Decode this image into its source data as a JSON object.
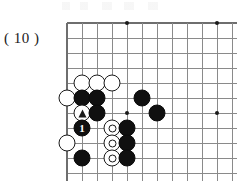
{
  "figure": {
    "label": "( 10 )"
  },
  "board": {
    "type": "go-board-diagram",
    "grid_spacing": 15,
    "origin_x": 67,
    "origin_y": 23,
    "columns": 12,
    "rows": 11,
    "edges": {
      "left": true,
      "top": true,
      "right": false,
      "bottom": true
    },
    "line_color": "#8a8a8a",
    "edge_color": "#6e6e6e",
    "star_point_color": "#1a1a1a",
    "black_color": "#101010",
    "white_color": "#ffffff",
    "star_points": [
      {
        "col": 4,
        "row": 0
      },
      {
        "col": 10,
        "row": 0
      },
      {
        "col": 4,
        "row": 6
      },
      {
        "col": 10,
        "row": 6
      }
    ],
    "stones": [
      {
        "col": 1,
        "row": 4,
        "color": "white",
        "marker": "none",
        "label": ""
      },
      {
        "col": 2,
        "row": 4,
        "color": "white",
        "marker": "none",
        "label": ""
      },
      {
        "col": 3,
        "row": 4,
        "color": "white",
        "marker": "none",
        "label": ""
      },
      {
        "col": 0,
        "row": 5,
        "color": "white",
        "marker": "none",
        "label": ""
      },
      {
        "col": 1,
        "row": 5,
        "color": "black",
        "marker": "none",
        "label": ""
      },
      {
        "col": 2,
        "row": 5,
        "color": "black",
        "marker": "none",
        "label": ""
      },
      {
        "col": 5,
        "row": 5,
        "color": "black",
        "marker": "none",
        "label": ""
      },
      {
        "col": 1,
        "row": 6,
        "color": "white",
        "marker": "triangle",
        "label": ""
      },
      {
        "col": 2,
        "row": 6,
        "color": "black",
        "marker": "none",
        "label": ""
      },
      {
        "col": 6,
        "row": 6,
        "color": "black",
        "marker": "none",
        "label": ""
      },
      {
        "col": 1,
        "row": 7,
        "color": "black",
        "marker": "none",
        "label": "1"
      },
      {
        "col": 3,
        "row": 7,
        "color": "white",
        "marker": "circle",
        "label": ""
      },
      {
        "col": 4,
        "row": 7,
        "color": "black",
        "marker": "none",
        "label": ""
      },
      {
        "col": 0,
        "row": 8,
        "color": "white",
        "marker": "none",
        "label": ""
      },
      {
        "col": 3,
        "row": 8,
        "color": "white",
        "marker": "circle",
        "label": ""
      },
      {
        "col": 4,
        "row": 8,
        "color": "black",
        "marker": "none",
        "label": ""
      },
      {
        "col": 1,
        "row": 9,
        "color": "black",
        "marker": "none",
        "label": ""
      },
      {
        "col": 3,
        "row": 9,
        "color": "white",
        "marker": "circle",
        "label": ""
      },
      {
        "col": 4,
        "row": 9,
        "color": "black",
        "marker": "none",
        "label": ""
      }
    ]
  }
}
